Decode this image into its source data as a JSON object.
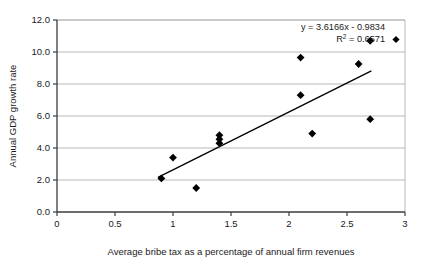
{
  "chart_data": {
    "type": "scatter",
    "title": "",
    "xlabel": "Average bribe tax as a percentage of annual firm revenues",
    "ylabel": "Annual GDP growth rate",
    "xlim": [
      0,
      3
    ],
    "ylim": [
      0,
      12
    ],
    "grid": true,
    "grid_axis": "y",
    "legend": "none",
    "xticks": [
      "0",
      "0.5",
      "1",
      "1.5",
      "2",
      "2.5",
      "3"
    ],
    "xtick_values": [
      0,
      0.5,
      1,
      1.5,
      2,
      2.5,
      3
    ],
    "yticks": [
      "0.0",
      "2.0",
      "4.0",
      "6.0",
      "8.0",
      "10.0",
      "12.0"
    ],
    "ytick_values": [
      0,
      2,
      4,
      6,
      8,
      10,
      12
    ],
    "marker": "diamond",
    "marker_color": "#000000",
    "points": [
      {
        "x": 0.9,
        "y": 2.1
      },
      {
        "x": 1.0,
        "y": 3.4
      },
      {
        "x": 1.2,
        "y": 1.5
      },
      {
        "x": 1.4,
        "y": 4.3
      },
      {
        "x": 1.4,
        "y": 4.55
      },
      {
        "x": 1.4,
        "y": 4.8
      },
      {
        "x": 2.1,
        "y": 7.3
      },
      {
        "x": 2.1,
        "y": 9.65
      },
      {
        "x": 2.2,
        "y": 4.9
      },
      {
        "x": 2.6,
        "y": 9.25
      },
      {
        "x": 2.7,
        "y": 5.8
      },
      {
        "x": 2.7,
        "y": 10.7
      }
    ],
    "trendline": {
      "type": "linear",
      "slope": 3.6166,
      "intercept": -0.9834,
      "x_start": 0.87,
      "x_end": 2.71,
      "color": "#000000"
    },
    "annotations": {
      "equation": "y = 3.6166x - 0.9834",
      "r_squared_prefix": "R",
      "r_squared_sup": "2",
      "r_squared_value": " = 0.6571"
    }
  },
  "colors": {
    "axis": "#3c3c3c",
    "grid": "#b8b8b8",
    "marker": "#000000",
    "trendline": "#000000",
    "text": "#1a1a1a",
    "background": "#ffffff"
  }
}
